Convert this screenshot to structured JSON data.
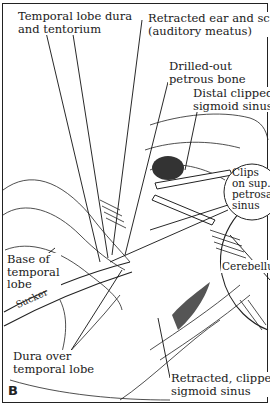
{
  "figure": {
    "panel_letter": "B",
    "labels": {
      "temporal_lobe_dura": [
        "Temporal lobe dura",
        "and tentorium"
      ],
      "retracted_ear": [
        "Retracted ear and scalp",
        "(auditory meatus)"
      ],
      "drilled_petrous": [
        "Drilled-out",
        "petrous bone"
      ],
      "distal_sigmoid": [
        "Distal clipped",
        "sigmoid sinus"
      ],
      "clips_petrosal": [
        "Clips",
        "on sup.",
        "petrosal",
        "sinus"
      ],
      "cerebellum": [
        "Cerebellum"
      ],
      "base_temporal": [
        "Base of",
        "temporal",
        "lobe"
      ],
      "sucker": [
        "Sucker"
      ],
      "dura_over_temporal": [
        "Dura over",
        "temporal lobe"
      ],
      "retracted_sigmoid": [
        "Retracted, clipped",
        "sigmoid sinus"
      ]
    }
  },
  "colors": {
    "ink": "#1a1a1a",
    "paper": "#ffffff",
    "shade": "#555555"
  }
}
